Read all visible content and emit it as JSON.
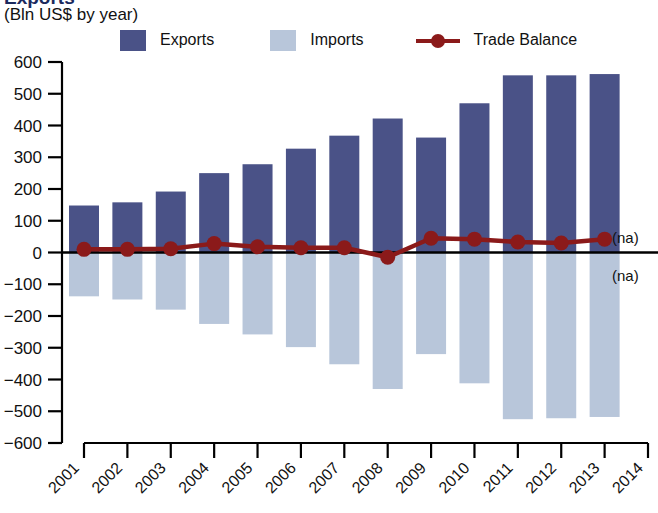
{
  "title": "Exports",
  "subtitle": "(Bln US$ by year)",
  "legend": {
    "exports_label": "Exports",
    "imports_label": "Imports",
    "balance_label": "Trade Balance"
  },
  "annotations": {
    "na_top": "(na)",
    "na_bottom": "(na)"
  },
  "colors": {
    "exports": "#4a5287",
    "imports": "#b8c6da",
    "balance": "#8b1a1a",
    "axis": "#000000",
    "background": "#ffffff"
  },
  "chart_data": {
    "type": "bar",
    "title": "Exports",
    "subtitle": "(Bln US$ by year)",
    "xlabel": "",
    "ylabel": "Bln US$",
    "ylim": [
      -600,
      600
    ],
    "ytick_step": 100,
    "yticks": [
      600,
      500,
      400,
      300,
      200,
      100,
      0,
      -100,
      -200,
      -300,
      -400,
      -500,
      -600
    ],
    "ytick_labels": [
      "600",
      "500",
      "400",
      "300",
      "200",
      "100",
      "0",
      "−100",
      "−200",
      "−300",
      "−400",
      "−500",
      "−600"
    ],
    "categories": [
      "2001",
      "2002",
      "2003",
      "2004",
      "2005",
      "2006",
      "2007",
      "2008",
      "2009",
      "2010",
      "2011",
      "2012",
      "2013",
      "2014"
    ],
    "x": [
      2001,
      2002,
      2003,
      2004,
      2005,
      2006,
      2007,
      2008,
      2009,
      2010,
      2011,
      2012,
      2013,
      2014
    ],
    "grid": false,
    "legend_position": "top",
    "series": [
      {
        "name": "Exports",
        "type": "bar",
        "color": "#4a5287",
        "values": [
          148,
          158,
          192,
          250,
          278,
          327,
          368,
          422,
          362,
          470,
          558,
          558,
          562,
          null
        ]
      },
      {
        "name": "Imports",
        "type": "bar",
        "color": "#b8c6da",
        "note": "plotted as negative values below the zero axis",
        "values": [
          -138,
          -148,
          -180,
          -225,
          -258,
          -298,
          -352,
          -430,
          -320,
          -412,
          -525,
          -522,
          -518,
          null
        ]
      },
      {
        "name": "Trade Balance",
        "type": "line",
        "color": "#8b1a1a",
        "marker": "circle",
        "values": [
          10,
          10,
          12,
          28,
          18,
          15,
          15,
          -15,
          45,
          42,
          33,
          30,
          42,
          null
        ]
      }
    ],
    "annotations": [
      {
        "text": "(na)",
        "x": 2014,
        "y": 60
      },
      {
        "text": "(na)",
        "x": 2014,
        "y": -60
      }
    ]
  }
}
